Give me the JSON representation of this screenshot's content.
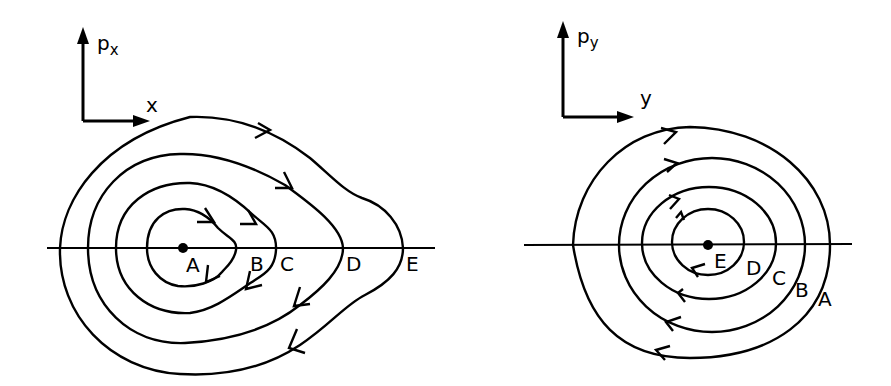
{
  "panels": [
    {
      "id": "left",
      "vertical_axis": {
        "label": "p",
        "subscript": "x"
      },
      "horizontal_axis": {
        "label": "x"
      },
      "center_label": "A",
      "orbit_labels": [
        "A",
        "B",
        "C",
        "D",
        "E"
      ],
      "direction": "clockwise"
    },
    {
      "id": "right",
      "vertical_axis": {
        "label": "p",
        "subscript": "y"
      },
      "horizontal_axis": {
        "label": "y"
      },
      "center_label": "E",
      "orbit_labels": [
        "E",
        "D",
        "C",
        "B",
        "A"
      ],
      "direction": "clockwise"
    }
  ],
  "colors": {
    "ink": "#000000",
    "background": "#ffffff"
  }
}
